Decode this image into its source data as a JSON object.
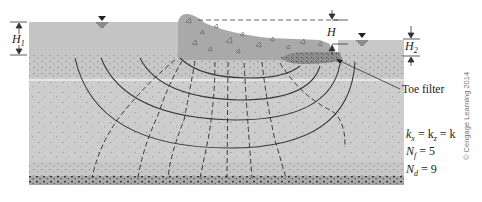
{
  "figure": {
    "labels": {
      "H1": {
        "main": "H",
        "sub": "1"
      },
      "H": {
        "main": "H"
      },
      "H2": {
        "main": "H",
        "sub": "2"
      },
      "toe_filter": "Toe filter"
    },
    "parameters": [
      {
        "lhs": "k",
        "lhs_sub": "x",
        "rhs": "= k",
        "rhs_sub": "z",
        "tail": "= k"
      },
      {
        "lhs": "N",
        "lhs_sub": "f",
        "rhs": "= 5"
      },
      {
        "lhs": "N",
        "lhs_sub": "d",
        "rhs": "= 9"
      }
    ],
    "copyright": "© Cengage Learning 2014",
    "colors": {
      "water": "#c4c4c4",
      "soil": "#cdcdcd",
      "dam": "#a9a9a9",
      "filter": "#8d8d8d",
      "bedrock": "#7a7a7a",
      "lines": "#3a3a3a"
    },
    "flow_net": {
      "flow_channels": 5,
      "equipotential_drops": 9
    }
  }
}
